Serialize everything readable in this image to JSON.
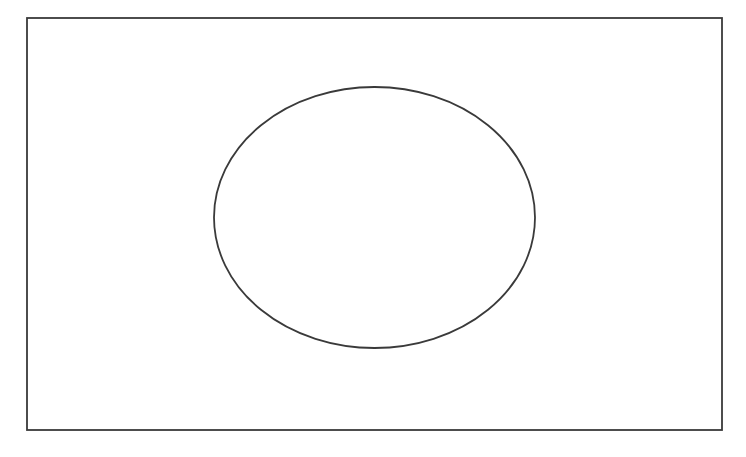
{
  "diagram": {
    "type": "venn",
    "canvas": {
      "width": 746,
      "height": 457,
      "background": "#ffffff"
    },
    "stroke_color": "#3a3a3a",
    "universe": {
      "shape": "rectangle",
      "x": 27,
      "y": 18,
      "width": 695,
      "height": 412,
      "stroke_width": 1.8,
      "fill": "none",
      "label": ""
    },
    "sets": [
      {
        "shape": "ellipse",
        "cx": 374.5,
        "cy": 217.5,
        "rx": 160.5,
        "ry": 130.5,
        "stroke_width": 1.8,
        "fill": "none",
        "label": ""
      }
    ]
  }
}
